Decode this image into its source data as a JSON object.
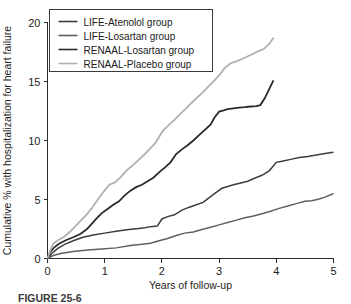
{
  "figure": {
    "caption": "FIGURE 25-6",
    "background_color": "#ffffff"
  },
  "chart_data": {
    "type": "line",
    "title": "",
    "xlabel": "Years of follow-up",
    "ylabel": "Cumulative % with hospitalization for heart failure",
    "xlim": [
      0,
      5
    ],
    "ylim": [
      0,
      20
    ],
    "xticks": [
      0,
      1,
      2,
      3,
      4,
      5
    ],
    "xtick_labels": [
      "0",
      "1",
      "2",
      "3",
      "4",
      "5"
    ],
    "yticks": [
      0,
      5,
      10,
      15,
      20
    ],
    "ytick_labels": [
      "0",
      "5",
      "10",
      "15",
      "20"
    ],
    "grid": false,
    "legend_position": "top-left",
    "series": [
      {
        "name": "LIFE-Atenolol group",
        "color": "#3d3d3d",
        "width": 1.5,
        "x": [
          0.0,
          0.08,
          0.18,
          0.3,
          0.45,
          0.62,
          0.8,
          1.0,
          1.2,
          1.42,
          1.6,
          1.7,
          1.8,
          1.92,
          2.0,
          2.1,
          2.22,
          2.35,
          2.48,
          2.6,
          2.72,
          2.85,
          2.95,
          3.05,
          3.15,
          3.25,
          3.38,
          3.5,
          3.62,
          3.75,
          3.88,
          4.0,
          4.1,
          4.25,
          4.4,
          4.55,
          4.7,
          4.85,
          5.0
        ],
        "y": [
          0.0,
          0.45,
          0.85,
          1.2,
          1.5,
          1.8,
          2.0,
          2.15,
          2.3,
          2.45,
          2.55,
          2.6,
          2.7,
          2.75,
          3.35,
          3.55,
          3.7,
          4.1,
          4.35,
          4.55,
          4.75,
          5.25,
          5.6,
          5.95,
          6.1,
          6.25,
          6.4,
          6.55,
          6.8,
          7.05,
          7.45,
          8.15,
          8.25,
          8.4,
          8.55,
          8.65,
          8.78,
          8.9,
          9.0
        ]
      },
      {
        "name": "LIFE-Losartan group",
        "color": "#606060",
        "width": 1.5,
        "x": [
          0.0,
          0.1,
          0.25,
          0.45,
          0.7,
          0.95,
          1.2,
          1.45,
          1.65,
          1.8,
          1.95,
          2.1,
          2.25,
          2.4,
          2.55,
          2.7,
          2.85,
          3.0,
          3.15,
          3.3,
          3.45,
          3.6,
          3.75,
          3.9,
          4.05,
          4.2,
          4.35,
          4.5,
          4.62,
          4.75,
          4.85,
          4.95,
          5.0
        ],
        "y": [
          0.0,
          0.25,
          0.45,
          0.6,
          0.72,
          0.8,
          0.9,
          1.1,
          1.2,
          1.3,
          1.5,
          1.7,
          1.95,
          2.15,
          2.25,
          2.45,
          2.65,
          2.85,
          3.05,
          3.25,
          3.45,
          3.6,
          3.8,
          4.0,
          4.25,
          4.45,
          4.65,
          4.85,
          4.9,
          5.05,
          5.2,
          5.4,
          5.5
        ]
      },
      {
        "name": "RENAAL-Losartan group",
        "color": "#2a2a2a",
        "width": 1.8,
        "x": [
          0.0,
          0.05,
          0.12,
          0.2,
          0.32,
          0.45,
          0.58,
          0.68,
          0.75,
          0.85,
          0.95,
          1.05,
          1.15,
          1.25,
          1.35,
          1.45,
          1.55,
          1.65,
          1.75,
          1.85,
          1.95,
          2.05,
          2.15,
          2.25,
          2.35,
          2.45,
          2.55,
          2.65,
          2.75,
          2.85,
          2.92,
          3.0,
          3.08,
          3.15,
          3.25,
          3.35,
          3.45,
          3.55,
          3.65,
          3.72,
          3.8,
          3.88,
          3.95
        ],
        "y": [
          0.0,
          0.55,
          0.95,
          1.25,
          1.55,
          1.8,
          2.1,
          2.45,
          2.8,
          3.35,
          3.85,
          4.2,
          4.55,
          4.85,
          5.35,
          5.75,
          6.05,
          6.25,
          6.55,
          6.85,
          7.3,
          7.7,
          8.15,
          8.85,
          9.25,
          9.6,
          10.0,
          10.45,
          10.9,
          11.35,
          11.95,
          12.45,
          12.55,
          12.65,
          12.72,
          12.78,
          12.82,
          12.88,
          12.92,
          13.0,
          13.6,
          14.4,
          15.1
        ]
      },
      {
        "name": "RENAAL-Placebo group",
        "color": "#b0b0b0",
        "width": 1.8,
        "x": [
          0.0,
          0.05,
          0.1,
          0.18,
          0.28,
          0.38,
          0.48,
          0.58,
          0.68,
          0.78,
          0.88,
          0.98,
          1.08,
          1.18,
          1.28,
          1.38,
          1.48,
          1.58,
          1.68,
          1.78,
          1.88,
          1.95,
          2.02,
          2.12,
          2.22,
          2.32,
          2.42,
          2.52,
          2.62,
          2.72,
          2.82,
          2.92,
          3.02,
          3.1,
          3.2,
          3.3,
          3.42,
          3.55,
          3.68,
          3.78,
          3.88,
          3.95
        ],
        "y": [
          0.0,
          0.7,
          1.25,
          1.55,
          1.8,
          2.2,
          2.7,
          3.2,
          3.7,
          4.3,
          5.0,
          5.65,
          6.25,
          6.45,
          6.9,
          7.45,
          7.85,
          8.3,
          8.75,
          9.25,
          9.75,
          10.3,
          10.85,
          11.3,
          11.75,
          12.25,
          12.7,
          13.2,
          13.65,
          14.1,
          14.6,
          15.1,
          15.65,
          16.15,
          16.55,
          16.7,
          16.95,
          17.25,
          17.55,
          17.75,
          18.2,
          18.7
        ]
      }
    ]
  },
  "legend": {
    "items": [
      {
        "label": "LIFE-Atenolol group",
        "color": "#3d3d3d"
      },
      {
        "label": "LIFE-Losartan group",
        "color": "#606060"
      },
      {
        "label": "RENAAL-Losartan group",
        "color": "#2a2a2a"
      },
      {
        "label": "RENAAL-Placebo group",
        "color": "#b0b0b0"
      }
    ]
  }
}
